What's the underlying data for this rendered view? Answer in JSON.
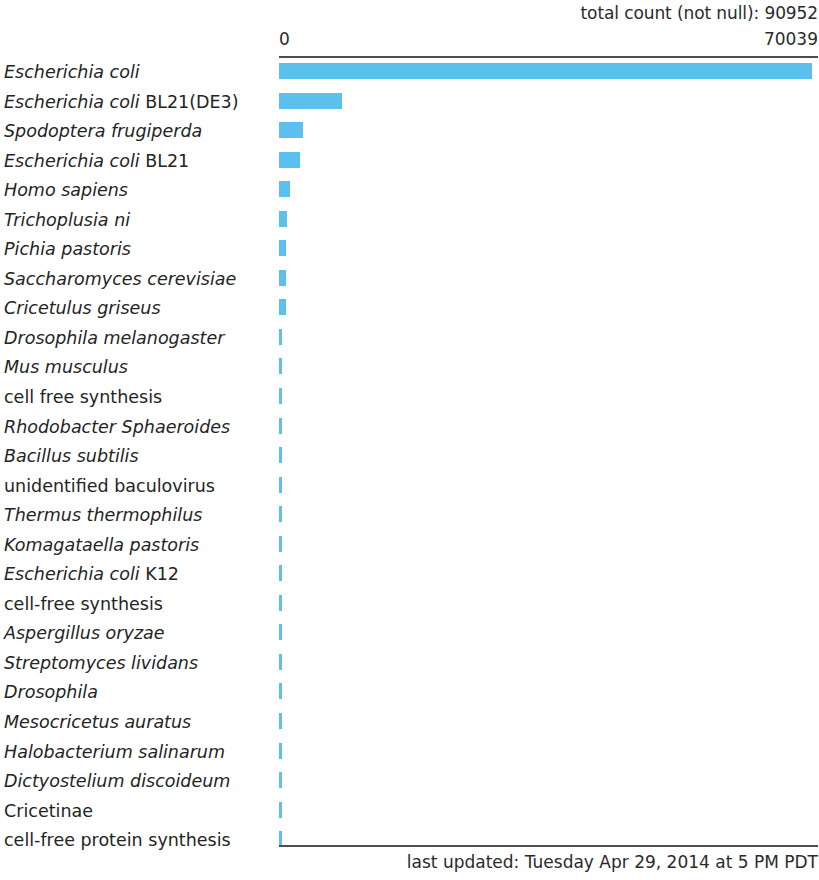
{
  "header": {
    "total_count_label": "total count (not null): 90952",
    "axis_min_label": "0",
    "axis_max_label": "70039"
  },
  "footer": {
    "last_updated": "last updated: Tuesday Apr 29, 2014 at 5 PM PDT"
  },
  "style": {
    "bar_color": "#5bc0ee",
    "axis_color": "#4d4d4d",
    "text_color": "#2b2b2b",
    "background": "#ffffff"
  },
  "chart_data": {
    "type": "bar",
    "orientation": "horizontal",
    "title": "total count (not null): 90952",
    "xlabel": "",
    "ylabel": "",
    "xlim": [
      0,
      70039
    ],
    "grid": false,
    "legend": false,
    "total_count_not_null": 90952,
    "axis_ticks": [
      "0",
      "70039"
    ],
    "categories": [
      "Escherichia coli",
      "Escherichia coli BL21(DE3)",
      "Spodoptera frugiperda",
      "Escherichia coli BL21",
      "Homo sapiens",
      "Trichoplusia ni",
      "Pichia pastoris",
      "Saccharomyces cerevisiae",
      "Cricetulus griseus",
      "Drosophila melanogaster",
      "Mus musculus",
      "cell free synthesis",
      "Rhodobacter Sphaeroides",
      "Bacillus subtilis",
      "unidentified baculovirus",
      "Thermus thermophilus",
      "Komagataella pastoris",
      "Escherichia coli K12",
      "cell-free synthesis",
      "Aspergillus oryzae",
      "Streptomyces lividans",
      "Drosophila",
      "Mesocricetus auratus",
      "Halobacterium salinarum",
      "Dictyostelium discoideum",
      "Cricetinae",
      "cell-free protein synthesis"
    ],
    "values": [
      70039,
      8200,
      3120,
      2730,
      1430,
      1040,
      910,
      910,
      910,
      390,
      390,
      390,
      390,
      390,
      390,
      390,
      390,
      390,
      390,
      390,
      390,
      390,
      390,
      390,
      390,
      390,
      390
    ]
  },
  "rows": [
    {
      "italic_part": "Escherichia coli",
      "roman_part": "",
      "all_roman": false,
      "value": 70039,
      "bar_px": 533
    },
    {
      "italic_part": "Escherichia coli",
      "roman_part": " BL21(DE3)",
      "all_roman": false,
      "value": 8200,
      "bar_px": 63
    },
    {
      "italic_part": "Spodoptera frugiperda",
      "roman_part": "",
      "all_roman": false,
      "value": 3120,
      "bar_px": 24
    },
    {
      "italic_part": "Escherichia coli",
      "roman_part": " BL21",
      "all_roman": false,
      "value": 2730,
      "bar_px": 21
    },
    {
      "italic_part": "Homo sapiens",
      "roman_part": "",
      "all_roman": false,
      "value": 1430,
      "bar_px": 11
    },
    {
      "italic_part": "Trichoplusia ni",
      "roman_part": "",
      "all_roman": false,
      "value": 1040,
      "bar_px": 8
    },
    {
      "italic_part": "Pichia pastoris",
      "roman_part": "",
      "all_roman": false,
      "value": 910,
      "bar_px": 7
    },
    {
      "italic_part": "Saccharomyces cerevisiae",
      "roman_part": "",
      "all_roman": false,
      "value": 910,
      "bar_px": 7
    },
    {
      "italic_part": "Cricetulus griseus",
      "roman_part": "",
      "all_roman": false,
      "value": 910,
      "bar_px": 7
    },
    {
      "italic_part": "Drosophila melanogaster",
      "roman_part": "",
      "all_roman": false,
      "value": 390,
      "bar_px": 3
    },
    {
      "italic_part": "Mus musculus",
      "roman_part": "",
      "all_roman": false,
      "value": 390,
      "bar_px": 3
    },
    {
      "italic_part": "cell free synthesis",
      "roman_part": "",
      "all_roman": true,
      "value": 390,
      "bar_px": 3
    },
    {
      "italic_part": "Rhodobacter Sphaeroides",
      "roman_part": "",
      "all_roman": false,
      "value": 390,
      "bar_px": 3
    },
    {
      "italic_part": "Bacillus subtilis",
      "roman_part": "",
      "all_roman": false,
      "value": 390,
      "bar_px": 3
    },
    {
      "italic_part": "unidentified baculovirus",
      "roman_part": "",
      "all_roman": true,
      "value": 390,
      "bar_px": 3
    },
    {
      "italic_part": "Thermus thermophilus",
      "roman_part": "",
      "all_roman": false,
      "value": 390,
      "bar_px": 3
    },
    {
      "italic_part": "Komagataella pastoris",
      "roman_part": "",
      "all_roman": false,
      "value": 390,
      "bar_px": 3
    },
    {
      "italic_part": "Escherichia coli",
      "roman_part": " K12",
      "all_roman": false,
      "value": 390,
      "bar_px": 3
    },
    {
      "italic_part": "cell-free synthesis",
      "roman_part": "",
      "all_roman": true,
      "value": 390,
      "bar_px": 3
    },
    {
      "italic_part": "Aspergillus oryzae",
      "roman_part": "",
      "all_roman": false,
      "value": 390,
      "bar_px": 3
    },
    {
      "italic_part": "Streptomyces lividans",
      "roman_part": "",
      "all_roman": false,
      "value": 390,
      "bar_px": 3
    },
    {
      "italic_part": "Drosophila",
      "roman_part": "",
      "all_roman": false,
      "value": 390,
      "bar_px": 3
    },
    {
      "italic_part": "Mesocricetus auratus",
      "roman_part": "",
      "all_roman": false,
      "value": 390,
      "bar_px": 3
    },
    {
      "italic_part": "Halobacterium salinarum",
      "roman_part": "",
      "all_roman": false,
      "value": 390,
      "bar_px": 3
    },
    {
      "italic_part": "Dictyostelium discoideum",
      "roman_part": "",
      "all_roman": false,
      "value": 390,
      "bar_px": 3
    },
    {
      "italic_part": "Cricetinae",
      "roman_part": "",
      "all_roman": true,
      "value": 390,
      "bar_px": 3
    },
    {
      "italic_part": "cell-free protein synthesis",
      "roman_part": "",
      "all_roman": true,
      "value": 390,
      "bar_px": 3
    }
  ]
}
